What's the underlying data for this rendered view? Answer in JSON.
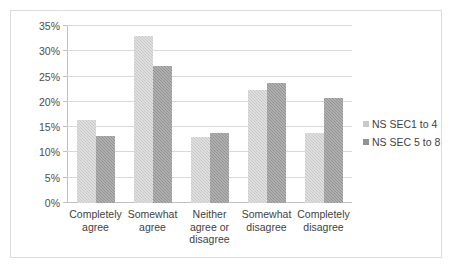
{
  "chart_data": {
    "type": "bar",
    "title": "",
    "subtitle": "",
    "xlabel": "",
    "ylabel": "",
    "ylim": [
      0,
      35
    ],
    "ytick_labels": [
      "0%",
      "5%",
      "10%",
      "15%",
      "20%",
      "25%",
      "30%",
      "35%"
    ],
    "ytick_values": [
      0,
      5,
      10,
      15,
      20,
      25,
      30,
      35
    ],
    "grid": true,
    "legend_position": "right",
    "categories": [
      "Completely agree",
      "Somewhat agree",
      "Neither agree or disagree",
      "Somewhat disagree",
      "Completely disagree"
    ],
    "category_lines": [
      [
        "Completely",
        "agree"
      ],
      [
        "Somewhat",
        "agree"
      ],
      [
        "Neither",
        "agree or",
        "disagree"
      ],
      [
        "Somewhat",
        "disagree"
      ],
      [
        "Completely",
        "disagree"
      ]
    ],
    "series": [
      {
        "name": "NS SEC1 to 4",
        "color": "#c9c9c9",
        "values": [
          16.5,
          33.0,
          13.0,
          22.4,
          13.8
        ]
      },
      {
        "name": "NS SEC 5 to 8",
        "color": "#939393",
        "values": [
          13.2,
          27.0,
          13.8,
          23.8,
          20.8
        ]
      }
    ]
  },
  "legend": {
    "items": [
      {
        "label": "NS SEC1 to 4",
        "color": "#c9c9c9"
      },
      {
        "label": "NS SEC 5 to 8",
        "color": "#939393"
      }
    ]
  },
  "colors": {
    "series_light": "#c9c9c9",
    "series_dark": "#939393",
    "gridline": "#d9d9d9",
    "axis": "#bfbfbf",
    "frame_border": "#dcdcdc",
    "text": "#3f3f3f",
    "background": "#ffffff"
  }
}
